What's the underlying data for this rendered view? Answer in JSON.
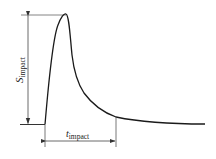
{
  "diagram": {
    "type": "impact pulse profile",
    "colors": {
      "curve": "#1a1a1a",
      "dimension": "#555555",
      "background": "#ffffff"
    },
    "labels": {
      "amplitude": {
        "main": "S",
        "sub": "impact"
      },
      "duration": {
        "main": "t",
        "sub": "impact"
      }
    },
    "curve_points_desc": "baseline rises sharply to peak, then decays exponentially toward a residual level"
  }
}
